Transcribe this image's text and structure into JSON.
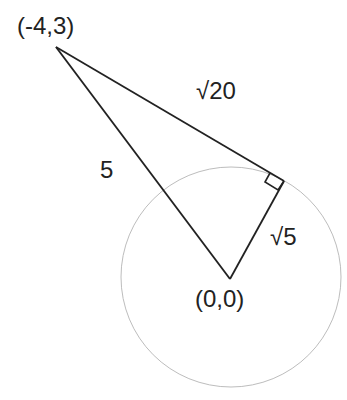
{
  "diagram": {
    "title": "",
    "points": {
      "external": {
        "label": "(-4,3)",
        "x": -4,
        "y": 3
      },
      "center": {
        "label": "(0,0)",
        "x": 0,
        "y": 0
      },
      "tangent": {
        "label": ""
      }
    },
    "segments": {
      "hypotenuse": {
        "label": "5",
        "from": "external",
        "to": "center"
      },
      "tangent_segment": {
        "label": "√20",
        "from": "external",
        "to": "tangent"
      },
      "radius": {
        "label": "√5",
        "from": "center",
        "to": "tangent"
      }
    },
    "right_angle_at": "tangent",
    "circle": {
      "center": "center",
      "radius_label": "√5"
    },
    "colors": {
      "line": "#222222",
      "circle": "#bbbbbb",
      "text": "#222222"
    }
  }
}
